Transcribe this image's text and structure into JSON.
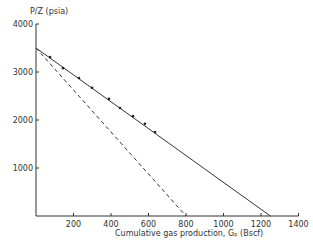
{
  "chart_data": {
    "type": "line",
    "title": "",
    "ylabel": "P/Z (psia)",
    "xlabel": "Cumulative gas production, Gp (Bscf)",
    "xlim": [
      0,
      1400
    ],
    "ylim": [
      0,
      4000
    ],
    "x_ticks": [
      200,
      400,
      600,
      800,
      1000,
      1200,
      1400
    ],
    "y_ticks": [
      1000,
      2000,
      3000,
      4000
    ],
    "grid": false,
    "series": [
      {
        "name": "measured P/Z data",
        "style": "points",
        "x": [
          75,
          144,
          229,
          299,
          389,
          448,
          517,
          581,
          635
        ],
        "y": [
          3310,
          3080,
          2875,
          2670,
          2440,
          2250,
          2080,
          1920,
          1750
        ]
      },
      {
        "name": "straight-line fit (solid)",
        "style": "solid",
        "x": [
          0,
          1250
        ],
        "y": [
          3500,
          0
        ]
      },
      {
        "name": "dashed line",
        "style": "dashed",
        "x": [
          0,
          800
        ],
        "y": [
          3500,
          0
        ]
      }
    ]
  },
  "labels": {
    "y_axis_title": "P/Z (psia)",
    "x_axis_title": "Cumulative gas production, Gₚ (Bscf)"
  }
}
